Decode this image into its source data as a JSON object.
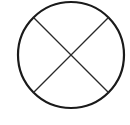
{
  "diagram": {
    "shape": "circle-with-x",
    "circle": {
      "cx": 71,
      "cy": 55,
      "r": 53,
      "stroke": "#1a1a1a",
      "stroke_width": 2.2
    },
    "cross": {
      "stroke": "#2a2a2a",
      "stroke_width": 1.3
    },
    "background": "#ffffff"
  }
}
